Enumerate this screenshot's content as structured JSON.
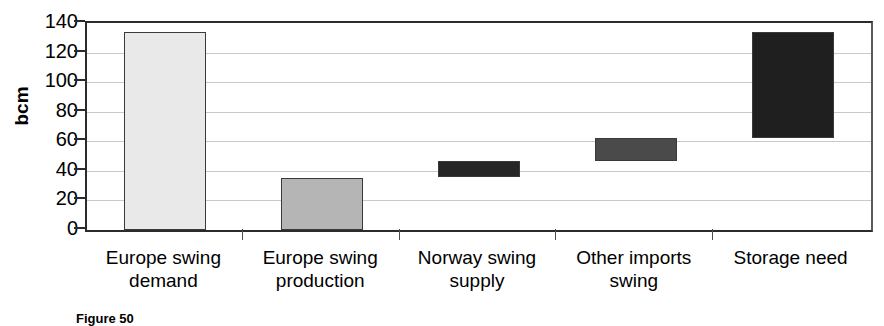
{
  "chart_data": {
    "type": "bar",
    "title": "",
    "subtitle": "",
    "xlabel": "",
    "ylabel": "bcm",
    "ylim": [
      0,
      140
    ],
    "yticks": [
      0,
      20,
      40,
      60,
      80,
      100,
      120,
      140
    ],
    "ytick_labels": [
      "0",
      "20",
      "40",
      "60",
      "80",
      "100",
      "120",
      "140"
    ],
    "grid": true,
    "legend": "none",
    "waterfall": true,
    "categories": [
      "Europe swing\ndemand",
      "Europe swing\nproduction",
      "Norway swing\nsupply",
      "Other imports\nswing",
      "Storage need"
    ],
    "bars": [
      {
        "label": "Europe swing demand",
        "base": 0,
        "top": 134,
        "value": 134,
        "color": "#e9e9e9"
      },
      {
        "label": "Europe swing production",
        "base": 0,
        "top": 35,
        "value": 35,
        "color": "#b5b5b5"
      },
      {
        "label": "Norway swing supply",
        "base": 36,
        "top": 47,
        "value": 11,
        "color": "#262626"
      },
      {
        "label": "Other imports swing",
        "base": 47,
        "top": 62,
        "value": 15,
        "color": "#4a4a4a"
      },
      {
        "label": "Storage need",
        "base": 62,
        "top": 134,
        "value": 72,
        "color": "#1f1f1f"
      }
    ]
  },
  "caption": {
    "text": "Figure 50"
  }
}
